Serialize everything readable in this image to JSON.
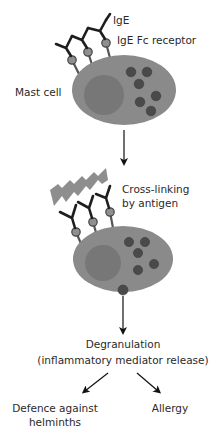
{
  "labels": {
    "ige": "IgE",
    "ige_fc_receptor": "IgE Fc receptor",
    "mast_cell": "Mast cell",
    "cross_linking_line1": "Cross-linking",
    "cross_linking_line2": "by antigen",
    "degranulation": "Degranulation",
    "degranulation_detail": "(inflammatory mediator release)",
    "outcome_left_line1": "Defence against",
    "outcome_left_line2": "helminths",
    "outcome_right": "Allergy"
  },
  "colors": {
    "cell_fill": "#8a8a8a",
    "nucleus_fill": "#777777",
    "granule_fill": "#4a4a4a",
    "antigen_fill": "#8e8e8e",
    "antibody_stroke": "#1e1e1e",
    "receptor_fill": "#8f8f8f",
    "arrow": "#111111",
    "text": "#2a2a2a"
  }
}
